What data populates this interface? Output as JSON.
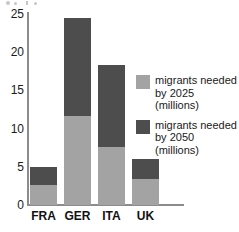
{
  "chart_data": {
    "type": "bar",
    "title": "",
    "subtitle": "",
    "xlabel": "",
    "ylabel": "",
    "stacked": true,
    "grid": false,
    "ylim": [
      0,
      25
    ],
    "yticks": [
      0,
      5,
      10,
      15,
      20,
      25
    ],
    "ytick_labels": [
      "0",
      "5",
      "10",
      "15",
      "20",
      "25"
    ],
    "categories": [
      "FRA",
      "GER",
      "ITA",
      "UK"
    ],
    "legend_position": "right",
    "series": [
      {
        "name": "migrants needed\nby 2025 (millions)",
        "color": "#a3a3a3",
        "values": [
          2.6,
          11.7,
          7.6,
          3.4
        ]
      },
      {
        "name": "migrants needed\nby 2050 (millions)",
        "color": "#4d4d4d",
        "values": [
          2.4,
          12.8,
          10.7,
          2.6
        ]
      }
    ],
    "totals": [
      5.0,
      24.5,
      18.3,
      6.0
    ]
  },
  "legend": {
    "items": [
      {
        "label": "migrants needed\nby 2025 (millions)",
        "color": "#a3a3a3"
      },
      {
        "label": "migrants needed\nby 2050 (millions)",
        "color": "#4d4d4d"
      }
    ]
  },
  "axis": {
    "y_tick_0": "0",
    "y_tick_1": "5",
    "y_tick_2": "10",
    "y_tick_3": "15",
    "y_tick_4": "20",
    "y_tick_5": "25"
  },
  "xaxis": {
    "label_0": "FRA",
    "label_1": "GER",
    "label_2": "ITA",
    "label_3": "UK"
  }
}
